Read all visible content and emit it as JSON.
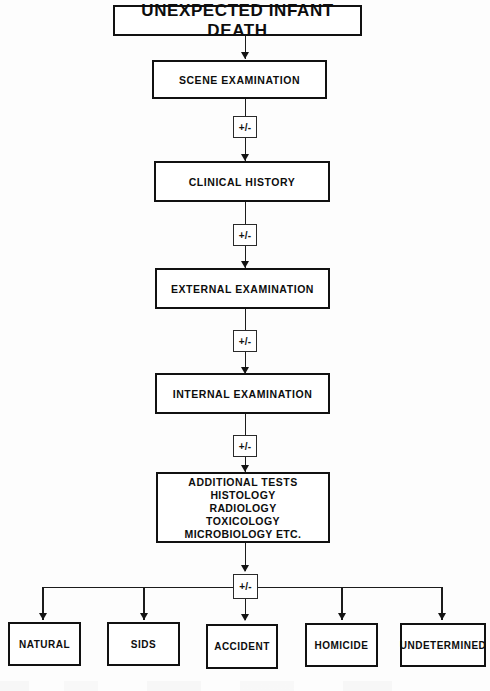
{
  "diagram": {
    "type": "flowchart",
    "title": "UNEXPECTED INFANT DEATH",
    "decision_label": "+/-",
    "stages": [
      {
        "id": "scene",
        "label": "SCENE EXAMINATION"
      },
      {
        "id": "clinical",
        "label": "CLINICAL HISTORY"
      },
      {
        "id": "external",
        "label": "EXTERNAL EXAMINATION"
      },
      {
        "id": "internal",
        "label": "INTERNAL EXAMINATION"
      }
    ],
    "additional_tests": {
      "heading": "ADDITIONAL TESTS",
      "items": [
        "HISTOLOGY",
        "RADIOLOGY",
        "TOXICOLOGY",
        "MICROBIOLOGY ETC."
      ]
    },
    "outcomes": [
      {
        "id": "natural",
        "label": "NATURAL"
      },
      {
        "id": "sids",
        "label": "SIDS"
      },
      {
        "id": "accident",
        "label": "ACCIDENT"
      },
      {
        "id": "homicide",
        "label": "HOMICIDE"
      },
      {
        "id": "undetermined",
        "label": "UNDETERMINED"
      }
    ],
    "colors": {
      "ink": "#111111",
      "line": "#1c1c1c",
      "paper": "#fdfdfd"
    }
  }
}
